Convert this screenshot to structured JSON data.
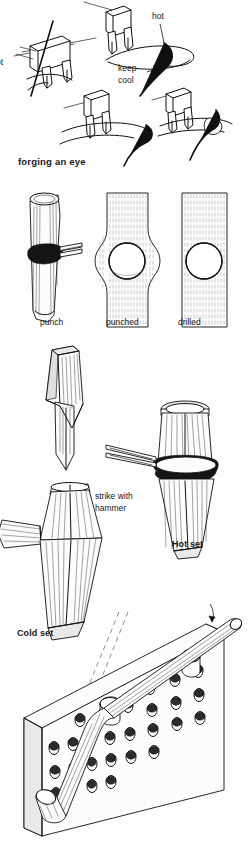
{
  "page": {
    "width": 248,
    "height": 841,
    "background_color": "#fdfdfd",
    "ink_color": "#111111"
  },
  "figures": {
    "forging_eye": {
      "caption": "forging an eye",
      "annotations": {
        "hot_right": "hot",
        "hot_left_clipped": "ot",
        "keep": "keep",
        "cool": "cool"
      },
      "steps": 4
    },
    "punching_row": {
      "items": [
        {
          "label": "punch"
        },
        {
          "label": "punched"
        },
        {
          "label": "drilled"
        }
      ]
    },
    "hardie": {
      "label": "Hardie"
    },
    "hot_set": {
      "label": "Hot set",
      "annotation_line1": "strike with",
      "annotation_line2": "hammer"
    },
    "cold_set": {
      "label": "Cold set"
    },
    "bending_plate": {
      "label": "",
      "hole_rows": 5,
      "holes_per_row": 6,
      "pegs": 2
    }
  }
}
